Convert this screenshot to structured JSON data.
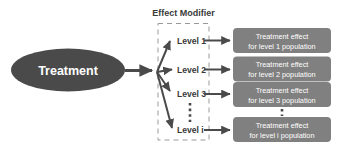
{
  "figure": {
    "background_color": "#ffffff",
    "title": "Effect Modifier"
  },
  "treatment_node": {
    "label": "Treatment",
    "fill_color": "#4a4a4a",
    "text_color": "#ffffff"
  },
  "effect_modifier_group": {
    "title": "Effect Modifier",
    "border_style": "dashed",
    "border_color": "#9a9a9a",
    "levels": [
      {
        "label": "Level 1"
      },
      {
        "label": "Level 2"
      },
      {
        "label": "Level 3"
      },
      {
        "label": "Level i"
      }
    ],
    "ellipsis": "vertical-dotted-line"
  },
  "outcome_boxes": {
    "fill_color": "#808080",
    "text_color": "#ffffff",
    "items": [
      {
        "line1": "Treatment effect",
        "line2": "for level 1 population"
      },
      {
        "line1": "Treatment effect",
        "line2": "for level 2 population"
      },
      {
        "line1": "Treatment effect",
        "line2": "for level 3 population"
      },
      {
        "line1": "Treatment effect",
        "line2": "for level i population"
      }
    ],
    "ellipsis": "vertical-dotted-line"
  },
  "connectors": {
    "color": "#4a4a4a",
    "treatment_to_fan": "arrow",
    "fan_to_levels": "arrow",
    "levels_to_boxes": "arrow"
  }
}
